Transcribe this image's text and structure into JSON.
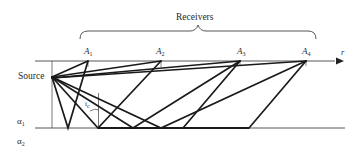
{
  "title": "Receivers",
  "labels": {
    "source": "Source",
    "axis_r": "r",
    "receivers": [
      {
        "name": "A",
        "sub": "1"
      },
      {
        "name": "A",
        "sub": "2"
      },
      {
        "name": "A",
        "sub": "3"
      },
      {
        "name": "A",
        "sub": "4"
      }
    ],
    "layer1": {
      "name": "α",
      "sub": "1"
    },
    "layer2": {
      "name": "α",
      "sub": "2"
    },
    "critical_angle": {
      "name": "i",
      "sub": "c"
    }
  },
  "colors": {
    "ray": "#1a1a1a",
    "guide": "#555555",
    "text": "#2a2a2a"
  }
}
